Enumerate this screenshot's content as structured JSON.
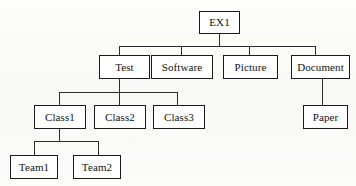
{
  "diagram": {
    "type": "tree",
    "line_color": "#2b2b2b",
    "box_border_color": "#1a1a1a",
    "box_fill_color": "#ffffff",
    "background_color": "#fbfbf9",
    "text_color": "#111111",
    "nodes": [
      {
        "id": "ex1",
        "label": "EX1",
        "x": 199,
        "y": 11,
        "w": 41,
        "h": 23,
        "level": 0,
        "parent": null
      },
      {
        "id": "test",
        "label": "Test",
        "x": 99,
        "y": 55,
        "w": 51,
        "h": 24,
        "level": 1,
        "parent": "ex1"
      },
      {
        "id": "software",
        "label": "Software",
        "x": 151,
        "y": 55,
        "w": 62,
        "h": 24,
        "level": 1,
        "parent": "ex1"
      },
      {
        "id": "picture",
        "label": "Picture",
        "x": 223,
        "y": 55,
        "w": 55,
        "h": 24,
        "level": 1,
        "parent": "ex1"
      },
      {
        "id": "document",
        "label": "Document",
        "x": 291,
        "y": 55,
        "w": 59,
        "h": 24,
        "level": 1,
        "parent": "ex1"
      },
      {
        "id": "class1",
        "label": "Class1",
        "x": 34,
        "y": 105,
        "w": 52,
        "h": 24,
        "level": 2,
        "parent": "test"
      },
      {
        "id": "class2",
        "label": "Class2",
        "x": 94,
        "y": 105,
        "w": 52,
        "h": 24,
        "level": 2,
        "parent": "test"
      },
      {
        "id": "class3",
        "label": "Class3",
        "x": 153,
        "y": 105,
        "w": 52,
        "h": 24,
        "level": 2,
        "parent": "test"
      },
      {
        "id": "paper",
        "label": "Paper",
        "x": 303,
        "y": 105,
        "w": 45,
        "h": 24,
        "level": 2,
        "parent": "document"
      },
      {
        "id": "team1",
        "label": "Team1",
        "x": 10,
        "y": 155,
        "w": 48,
        "h": 24,
        "level": 3,
        "parent": "class1"
      },
      {
        "id": "team2",
        "label": "Team2",
        "x": 73,
        "y": 155,
        "w": 48,
        "h": 24,
        "level": 3,
        "parent": "class1"
      }
    ],
    "edges": [
      {
        "from": "ex1",
        "to": "test"
      },
      {
        "from": "ex1",
        "to": "software"
      },
      {
        "from": "ex1",
        "to": "picture"
      },
      {
        "from": "ex1",
        "to": "document"
      },
      {
        "from": "test",
        "to": "class1"
      },
      {
        "from": "test",
        "to": "class2"
      },
      {
        "from": "test",
        "to": "class3"
      },
      {
        "from": "document",
        "to": "paper"
      },
      {
        "from": "class1",
        "to": "team1"
      },
      {
        "from": "class1",
        "to": "team2"
      }
    ],
    "connector_segments": [
      {
        "id": "ex1-stem",
        "x1": 219,
        "y1": 34,
        "x2": 219,
        "y2": 46
      },
      {
        "id": "ex1-bus",
        "x1": 119,
        "y1": 46,
        "x2": 315,
        "y2": 46
      },
      {
        "id": "drop-test",
        "x1": 119,
        "y1": 46,
        "x2": 119,
        "y2": 55
      },
      {
        "id": "drop-software",
        "x1": 181,
        "y1": 46,
        "x2": 181,
        "y2": 55
      },
      {
        "id": "drop-picture",
        "x1": 249,
        "y1": 46,
        "x2": 249,
        "y2": 55
      },
      {
        "id": "drop-document",
        "x1": 315,
        "y1": 46,
        "x2": 315,
        "y2": 55
      },
      {
        "id": "test-stem",
        "x1": 119,
        "y1": 79,
        "x2": 119,
        "y2": 92
      },
      {
        "id": "test-bus",
        "x1": 59,
        "y1": 92,
        "x2": 177,
        "y2": 92
      },
      {
        "id": "drop-class1",
        "x1": 59,
        "y1": 92,
        "x2": 59,
        "y2": 105
      },
      {
        "id": "drop-class2",
        "x1": 119,
        "y1": 92,
        "x2": 119,
        "y2": 105
      },
      {
        "id": "drop-class3",
        "x1": 177,
        "y1": 92,
        "x2": 177,
        "y2": 105
      },
      {
        "id": "document-stem",
        "x1": 322,
        "y1": 79,
        "x2": 322,
        "y2": 105
      },
      {
        "id": "class1-stem",
        "x1": 59,
        "y1": 129,
        "x2": 59,
        "y2": 141
      },
      {
        "id": "class1-bus",
        "x1": 34,
        "y1": 141,
        "x2": 98,
        "y2": 141
      },
      {
        "id": "drop-team1",
        "x1": 34,
        "y1": 141,
        "x2": 34,
        "y2": 155
      },
      {
        "id": "drop-team2",
        "x1": 98,
        "y1": 141,
        "x2": 98,
        "y2": 155
      }
    ]
  }
}
